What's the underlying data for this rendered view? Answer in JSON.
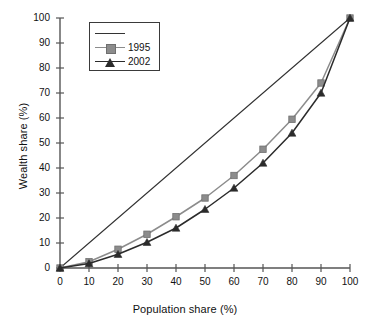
{
  "chart_data": {
    "type": "line",
    "title": "",
    "xlabel": "Population share (%)",
    "ylabel": "Wealth share (%)",
    "xlim": [
      0,
      100
    ],
    "ylim": [
      0,
      100
    ],
    "xticks": [
      0,
      10,
      20,
      30,
      40,
      50,
      60,
      70,
      80,
      90,
      100
    ],
    "yticks": [
      0,
      10,
      20,
      30,
      40,
      50,
      60,
      70,
      80,
      90,
      100
    ],
    "grid": false,
    "legend_position": "upper-left",
    "x": [
      0,
      10,
      20,
      30,
      40,
      50,
      60,
      70,
      80,
      90,
      100
    ],
    "series": [
      {
        "name": "",
        "legend_label": "",
        "marker": "none",
        "color": "#333333",
        "values": [
          0,
          10,
          20,
          30,
          40,
          50,
          60,
          70,
          80,
          90,
          100
        ]
      },
      {
        "name": "1995",
        "legend_label": "1995",
        "marker": "square",
        "color": "#8c8c8c",
        "values": [
          0,
          2.5,
          7.5,
          13.5,
          20.5,
          28,
          37,
          47.5,
          59.5,
          74,
          100
        ]
      },
      {
        "name": "2002",
        "legend_label": "2002",
        "marker": "triangle",
        "color": "#2b2b2b",
        "values": [
          0,
          1.8,
          5.5,
          10.3,
          16,
          23.5,
          32,
          42,
          54,
          70,
          100
        ]
      }
    ]
  },
  "axes": {
    "x_title": "Population share (%)",
    "y_title": "Wealth share (%)",
    "x_tick_labels": [
      "0",
      "10",
      "20",
      "30",
      "40",
      "50",
      "60",
      "70",
      "80",
      "90",
      "100"
    ],
    "y_tick_labels": [
      "0",
      "10",
      "20",
      "30",
      "40",
      "50",
      "60",
      "70",
      "80",
      "90",
      "100"
    ]
  },
  "legend": {
    "entries": [
      {
        "label": "",
        "marker": "line-only",
        "color": "#333333"
      },
      {
        "label": "1995",
        "marker": "square",
        "color": "#8c8c8c"
      },
      {
        "label": "2002",
        "marker": "triangle",
        "color": "#2b2b2b"
      }
    ]
  },
  "colors": {
    "background": "#ffffff",
    "axis": "#555555",
    "series_1995": "#8c8c8c",
    "series_2002": "#2b2b2b",
    "equality_line": "#333333"
  }
}
